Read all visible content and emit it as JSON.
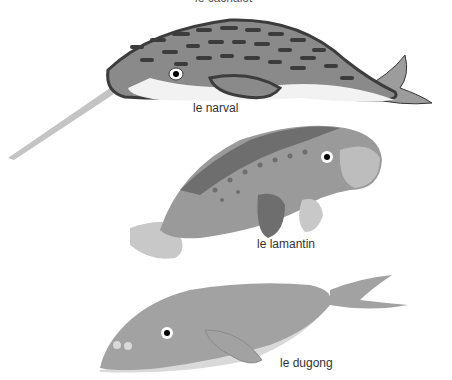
{
  "title_fragment": "le cachalot",
  "animals": [
    {
      "name": "narwhal",
      "label": "le narval"
    },
    {
      "name": "manatee",
      "label": "le lamantin"
    },
    {
      "name": "dugong",
      "label": "le dugong"
    }
  ],
  "colors": {
    "narwhal_dark": "#3c3c3c",
    "narwhal_mid": "#8a8a8a",
    "narwhal_belly": "#f2f2f2",
    "manatee_body": "#9a9a9a",
    "manatee_dark": "#6e6e6e",
    "manatee_light": "#c8c8c8",
    "dugong_body": "#a2a2a2",
    "dugong_belly": "#d9d9d9"
  }
}
